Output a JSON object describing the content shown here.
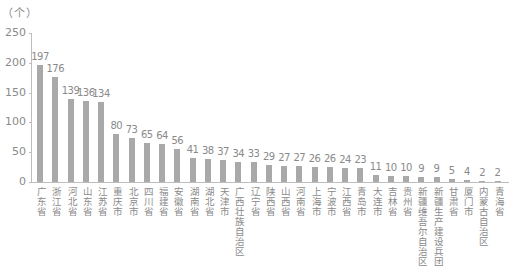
{
  "chart_data": {
    "type": "bar",
    "title": "",
    "unit_label": "（个）",
    "xlabel": "",
    "ylabel": "（个）",
    "ylim": [
      0,
      250
    ],
    "yticks": [
      0,
      50,
      100,
      150,
      200,
      250
    ],
    "grid": false,
    "legend": null,
    "bar_color": "#a9a9a9",
    "categories": [
      "广东省",
      "浙江省",
      "河北省",
      "山东省",
      "江苏省",
      "重庆市",
      "北京市",
      "四川省",
      "福建省",
      "安徽省",
      "湖南省",
      "湖北省",
      "天津市",
      "广西壮族自治区",
      "辽宁省",
      "陕西省",
      "山西省",
      "河南省",
      "上海市",
      "宁波市",
      "江西省",
      "青岛市",
      "大连市",
      "吉林省",
      "贵州省",
      "新疆维吾尔自治区",
      "新疆生产建设兵团",
      "甘肃省",
      "厦门市",
      "内蒙古自治区",
      "青海省"
    ],
    "values": [
      197,
      176,
      139,
      136,
      134,
      80,
      73,
      65,
      64,
      56,
      41,
      38,
      37,
      34,
      33,
      29,
      27,
      27,
      26,
      26,
      24,
      23,
      11,
      10,
      10,
      9,
      9,
      5,
      4,
      2,
      2
    ]
  }
}
